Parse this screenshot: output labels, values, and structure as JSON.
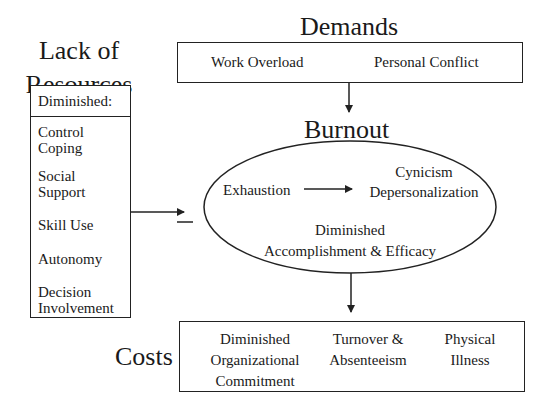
{
  "resources": {
    "title_line1": "Lack of",
    "title_line2": "Resources",
    "subheader": "Diminished:",
    "items": [
      {
        "line1": "Control",
        "line2": "Coping"
      },
      {
        "line1": "Social",
        "line2": "Support"
      },
      {
        "line1": "Skill Use",
        "line2": ""
      },
      {
        "line1": "Autonomy",
        "line2": ""
      },
      {
        "line1": "Decision",
        "line2": "Involvement"
      }
    ],
    "link_sign": "−"
  },
  "demands": {
    "title": "Demands",
    "items": [
      "Work Overload",
      "Personal Conflict"
    ]
  },
  "burnout": {
    "title": "Burnout",
    "exhaustion": "Exhaustion",
    "cynicism_line1": "Cynicism",
    "cynicism_line2": "Depersonalization",
    "efficacy_line1": "Diminished",
    "efficacy_line2": "Accomplishment & Efficacy"
  },
  "costs": {
    "title": "Costs",
    "items": [
      {
        "line1": "Diminished",
        "line2": "Organizational",
        "line3": "Commitment"
      },
      {
        "line1": "Turnover &",
        "line2": "Absenteeism",
        "line3": ""
      },
      {
        "line1": "Physical",
        "line2": "Illness",
        "line3": ""
      }
    ]
  }
}
